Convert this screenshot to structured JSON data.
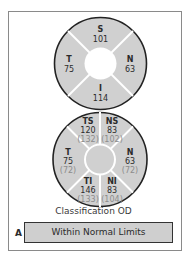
{
  "quadrant_chart": {
    "sectors": [
      {
        "label": "S",
        "value": "101"
      },
      {
        "label": "T",
        "value": "75"
      },
      {
        "label": "N",
        "value": "63"
      },
      {
        "label": "I",
        "value": "114"
      }
    ]
  },
  "clock_chart": {
    "sectors": [
      {
        "label": "TS",
        "value": "120",
        "ref": "(132)"
      },
      {
        "label": "NS",
        "value": "83",
        "ref": "(102)"
      },
      {
        "label": "T",
        "value": "75",
        "ref": "(72)"
      },
      {
        "label": "N",
        "value": "63",
        "ref": "(72)"
      },
      {
        "label": "TI",
        "value": "146",
        "ref": "(133)"
      },
      {
        "label": "NI",
        "value": "83",
        "ref": "(104)"
      }
    ]
  },
  "classification": {
    "title": "Classification OD",
    "row_label": "A",
    "status": "Within Normal Limits"
  },
  "colors": {
    "sector_fill": "#d0d0d0",
    "outline": "#222222",
    "divider": "#ffffff"
  }
}
